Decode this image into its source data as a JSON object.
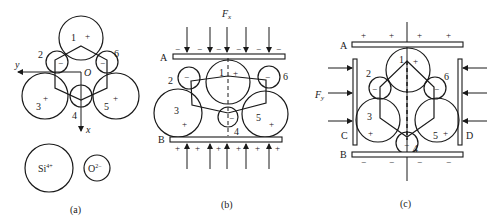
{
  "panels": {
    "a": {
      "caption": "(a)",
      "axis_y_label": "y",
      "axis_x_label": "x",
      "origin_label": "O",
      "atoms": [
        {
          "id": "1",
          "label": "1",
          "charge": "+"
        },
        {
          "id": "2",
          "label": "2",
          "charge": "−"
        },
        {
          "id": "3",
          "label": "3",
          "charge": "+"
        },
        {
          "id": "4",
          "label": "4",
          "charge": ""
        },
        {
          "id": "5",
          "label": "5",
          "charge": "+"
        },
        {
          "id": "6",
          "label": "6",
          "charge": "−"
        }
      ],
      "legend": {
        "si_label": "Si",
        "si_sup": "4+",
        "o_label": "O",
        "o_sup": "2−"
      }
    },
    "b": {
      "caption": "(b)",
      "force_label": "F",
      "force_sub": "x",
      "plate_top": "A",
      "plate_bottom": "B",
      "top_signs": [
        "−",
        "−",
        "−",
        "−",
        "−",
        "−"
      ],
      "bottom_signs": [
        "+",
        "+",
        "+",
        "+",
        "+",
        "+"
      ],
      "atoms": [
        {
          "id": "1",
          "label": "1",
          "charge": "+"
        },
        {
          "id": "2",
          "label": "2",
          "charge": "−"
        },
        {
          "id": "3",
          "label": "3",
          "charge": "+"
        },
        {
          "id": "4",
          "label": "4",
          "charge": "−"
        },
        {
          "id": "5",
          "label": "5",
          "charge": "+"
        },
        {
          "id": "6",
          "label": "6",
          "charge": "−"
        }
      ]
    },
    "c": {
      "caption": "(c)",
      "force_label": "F",
      "force_sub": "y",
      "plate_top": "A",
      "plate_bottom": "B",
      "plate_left": "C",
      "plate_right": "D",
      "top_signs": [
        "+",
        "+",
        "+",
        "+"
      ],
      "bottom_signs": [
        "−",
        "−",
        "−",
        "−"
      ],
      "atoms": [
        {
          "id": "1",
          "label": "1",
          "charge": "+"
        },
        {
          "id": "2",
          "label": "2",
          "charge": "−"
        },
        {
          "id": "3",
          "label": "3",
          "charge": "+"
        },
        {
          "id": "4",
          "label": "4",
          "charge": "−"
        },
        {
          "id": "5",
          "label": "5",
          "charge": "+"
        },
        {
          "id": "6",
          "label": "6",
          "charge": "−"
        }
      ]
    }
  }
}
